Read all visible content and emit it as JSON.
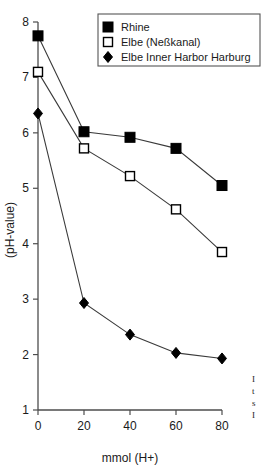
{
  "chart_data": {
    "type": "line",
    "title": "",
    "xlabel": "mmol (H+)",
    "ylabel": "(pH-value)",
    "x": [
      0,
      20,
      40,
      60,
      80
    ],
    "xlim": [
      0,
      80
    ],
    "ylim": [
      1,
      8
    ],
    "xticks": [
      "0",
      "20",
      "40",
      "60",
      "80"
    ],
    "yticks": [
      "1",
      "2",
      "3",
      "4",
      "5",
      "6",
      "7",
      "8"
    ],
    "grid": false,
    "legend_position": "top-right",
    "series": [
      {
        "name": "Rhine",
        "marker": "filled-square",
        "values": [
          7.75,
          6.02,
          5.92,
          5.72,
          5.05
        ]
      },
      {
        "name": "Elbe (Neßkanal)",
        "marker": "open-square",
        "values": [
          7.1,
          5.72,
          5.22,
          4.62,
          3.85
        ]
      },
      {
        "name": "Elbe Inner Harbor Harburg",
        "marker": "filled-diamond",
        "values": [
          6.35,
          2.93,
          2.36,
          2.03,
          1.93
        ]
      }
    ]
  },
  "legend": {
    "entries": [
      {
        "label": "Rhine"
      },
      {
        "label": "Elbe (Neßkanal)"
      },
      {
        "label": "Elbe Inner Harbor Harburg"
      }
    ]
  },
  "caption": {
    "lines": [
      "I",
      "t",
      "s",
      "I"
    ]
  }
}
